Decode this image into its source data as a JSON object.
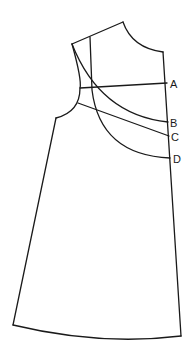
{
  "diagram": {
    "type": "sewing-pattern",
    "stroke_color": "#1a1a1a",
    "background": "#ffffff",
    "labels": [
      {
        "id": "A",
        "text": "A",
        "x": 170,
        "y": 88
      },
      {
        "id": "B",
        "text": "B",
        "x": 170,
        "y": 127
      },
      {
        "id": "C",
        "text": "C",
        "x": 171,
        "y": 141
      },
      {
        "id": "D",
        "text": "D",
        "x": 173,
        "y": 163
      }
    ]
  }
}
